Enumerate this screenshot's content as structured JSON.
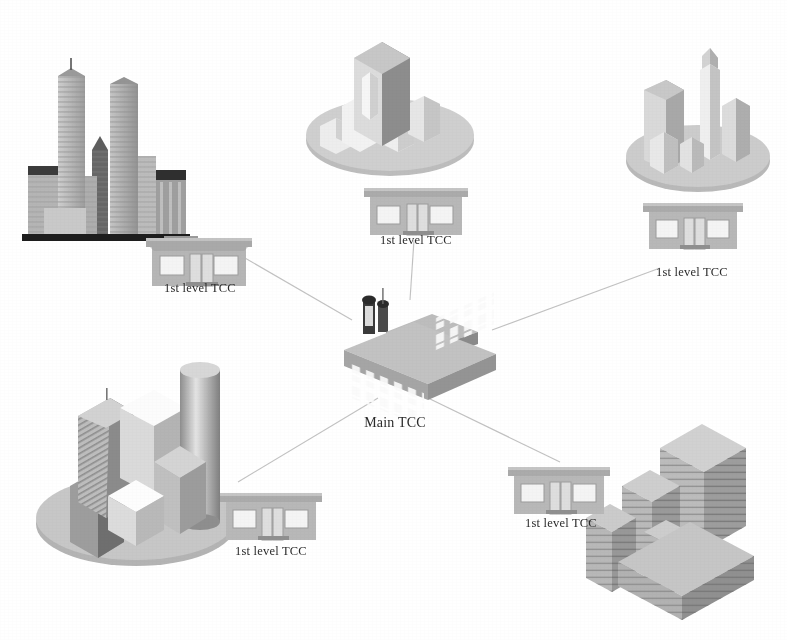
{
  "diagram": {
    "type": "hub-and-spoke",
    "background_color": "#ffffff",
    "line_color": "#b9b9b9",
    "label_color": "#2b2b2b",
    "hub": {
      "label": "Main TCC",
      "icon": "factory-building-icon",
      "x": 395,
      "y": 424
    },
    "nodes": [
      {
        "id": "tcc-top-left",
        "label": "1st level TCC",
        "icon": "small-office-building-icon",
        "city_icon": "city-skyline-towers-icon",
        "label_x": 200,
        "label_y": 288
      },
      {
        "id": "tcc-top-center",
        "label": "1st level TCC",
        "icon": "small-office-building-icon",
        "city_icon": "city-disc-block-tower-icon",
        "label_x": 416,
        "label_y": 240
      },
      {
        "id": "tcc-top-right",
        "label": "1st level TCC",
        "icon": "small-office-building-icon",
        "city_icon": "city-disc-spire-icon",
        "label_x": 690,
        "label_y": 272
      },
      {
        "id": "tcc-bottom-left",
        "label": "1st level TCC",
        "icon": "small-office-building-icon",
        "city_icon": "city-disc-cylinder-tower-icon",
        "label_x": 270,
        "label_y": 551
      },
      {
        "id": "tcc-bottom-right",
        "label": "1st level TCC",
        "icon": "small-office-building-icon",
        "city_icon": "city-isometric-towers-icon",
        "label_x": 560,
        "label_y": 523
      }
    ],
    "links": [
      {
        "from": "main-tcc",
        "to": "tcc-top-left"
      },
      {
        "from": "main-tcc",
        "to": "tcc-top-center"
      },
      {
        "from": "main-tcc",
        "to": "tcc-top-right"
      },
      {
        "from": "main-tcc",
        "to": "tcc-bottom-left"
      },
      {
        "from": "main-tcc",
        "to": "tcc-bottom-right"
      }
    ],
    "colors": {
      "line": "#bdbdbd",
      "building_face": "#b7b7b7",
      "building_light": "#d8d8d8",
      "building_dark": "#8f8f8f",
      "window": "#f2f2f2",
      "disc": "#c0c0c0",
      "ink": "#2b2b2b"
    }
  }
}
